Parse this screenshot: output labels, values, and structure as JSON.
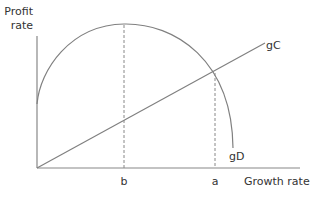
{
  "diagram": {
    "y_axis_label_line1": "Profit",
    "y_axis_label_line2": "rate",
    "x_axis_label": "Growth rate",
    "curves": {
      "gC": "gC",
      "gD": "gD"
    },
    "x_markers": {
      "b": "b",
      "a": "a"
    },
    "colors": {
      "axis": "#888888",
      "curve": "#808080",
      "text": "#333333"
    }
  }
}
